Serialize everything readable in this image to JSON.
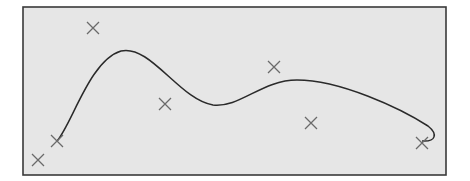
{
  "chart_data": {
    "type": "scatter",
    "title": "",
    "xlabel": "",
    "ylabel": "",
    "grid": false,
    "legend": null,
    "axes_visible": false,
    "coordinate_note": "No axes or ticks shown; coordinates are in figure pixel space (origin top-left)",
    "frame": {
      "x": 23,
      "y": 7,
      "width": 423,
      "height": 168,
      "fill": "#e6e6e6",
      "stroke": "#3a3a3a"
    },
    "series": [
      {
        "name": "data points",
        "kind": "scatter",
        "marker": "x",
        "color": "#6a6a6a",
        "points": [
          {
            "x": 38,
            "y": 160
          },
          {
            "x": 57,
            "y": 141
          },
          {
            "x": 93,
            "y": 28
          },
          {
            "x": 165,
            "y": 104
          },
          {
            "x": 274,
            "y": 67
          },
          {
            "x": 311,
            "y": 123
          },
          {
            "x": 422,
            "y": 143
          }
        ]
      },
      {
        "name": "fitted curve",
        "kind": "line",
        "color": "#2a2a2a",
        "path": "M 57 141 C 72 124, 90 60, 121 51 C 150 44, 180 100, 213 105 C 240 108, 262 80, 297 80 C 340 80, 400 108, 428 126 C 438 134, 436 142, 422 141"
      }
    ]
  }
}
